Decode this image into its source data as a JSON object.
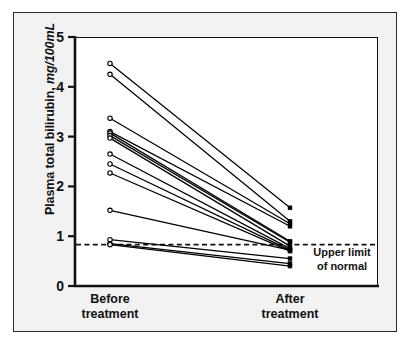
{
  "figure": {
    "background_color": "#f2f2f2",
    "panel_color": "#ffffff",
    "frame_color": "#2b2b2b",
    "line_color": "#000000"
  },
  "axes": {
    "y_title_text": "Plasma total bilirubin, ",
    "y_title_units": "mg/100mL",
    "y_ticks": [
      "5",
      "4",
      "3",
      "2",
      "1",
      "0"
    ],
    "y_min": 0,
    "y_max": 5,
    "x_categories": [
      {
        "line1": "Before",
        "line2": "treatment"
      },
      {
        "line1": "After",
        "line2": "treatment"
      }
    ]
  },
  "annotation": {
    "line1": "Upper limit",
    "line2": "of normal",
    "reference_value": 0.83
  },
  "chart_data": {
    "type": "line",
    "title": "",
    "subtitle": "",
    "xlabel": "",
    "ylabel": "Plasma total bilirubin, mg/100mL",
    "categories": [
      "Before treatment",
      "After treatment"
    ],
    "ylim": [
      0,
      5
    ],
    "yticks": [
      0,
      1,
      2,
      3,
      4,
      5
    ],
    "grid": false,
    "legend": "none",
    "reference_lines": [
      {
        "label": "Upper limit of normal",
        "value": 0.83,
        "style": "dashed",
        "orientation": "horizontal"
      }
    ],
    "marker_before": "open-circle",
    "marker_after": "filled-square",
    "n_subjects": 14,
    "series": [
      {
        "name": "Subject 1",
        "values": [
          4.47,
          1.57
        ]
      },
      {
        "name": "Subject 2",
        "values": [
          4.25,
          1.3
        ]
      },
      {
        "name": "Subject 3",
        "values": [
          3.37,
          1.25
        ]
      },
      {
        "name": "Subject 4",
        "values": [
          3.1,
          1.2
        ]
      },
      {
        "name": "Subject 5",
        "values": [
          3.07,
          0.9
        ]
      },
      {
        "name": "Subject 6",
        "values": [
          3.02,
          0.88
        ]
      },
      {
        "name": "Subject 7",
        "values": [
          2.97,
          0.8
        ]
      },
      {
        "name": "Subject 8",
        "values": [
          2.65,
          0.75
        ]
      },
      {
        "name": "Subject 9",
        "values": [
          2.45,
          0.72
        ]
      },
      {
        "name": "Subject 10",
        "values": [
          2.27,
          0.7
        ]
      },
      {
        "name": "Subject 11",
        "values": [
          1.52,
          0.72
        ]
      },
      {
        "name": "Subject 12",
        "values": [
          0.93,
          0.55
        ]
      },
      {
        "name": "Subject 13",
        "values": [
          0.85,
          0.45
        ]
      },
      {
        "name": "Subject 14",
        "values": [
          0.83,
          0.4
        ]
      }
    ]
  }
}
